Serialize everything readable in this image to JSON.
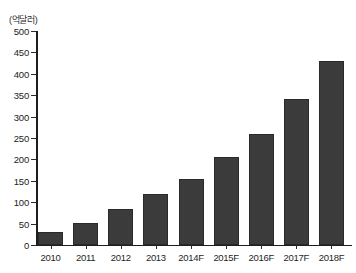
{
  "chart_data": {
    "type": "bar",
    "title": "",
    "subtitle": "",
    "xlabel": "",
    "ylabel": "",
    "unit_label": "(억달러)",
    "categories": [
      "2010",
      "2011",
      "2012",
      "2013",
      "2014F",
      "2015F",
      "2016F",
      "2017F",
      "2018F"
    ],
    "values": [
      30,
      52,
      85,
      120,
      155,
      205,
      260,
      340,
      430
    ],
    "series": [
      {
        "name": "",
        "values": [
          30,
          52,
          85,
          120,
          155,
          205,
          260,
          340,
          430
        ]
      }
    ],
    "ylim": [
      0,
      500
    ],
    "ytick_step": 50,
    "ytick_labels": [
      "0",
      "50",
      "100",
      "150",
      "200",
      "250",
      "300",
      "350",
      "400",
      "450",
      "500"
    ],
    "ytick_values": [
      0,
      50,
      100,
      150,
      200,
      250,
      300,
      350,
      400,
      450,
      500
    ],
    "grid": false,
    "legend": false,
    "legend_position": "none",
    "bar_color": "#3b3b3b",
    "axis_color": "#1d1d1d",
    "background_color": "#ffffff"
  }
}
